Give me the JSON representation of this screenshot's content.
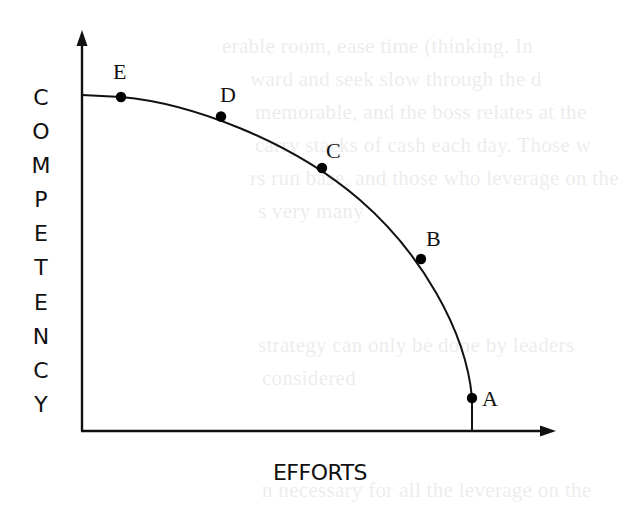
{
  "figure": {
    "y_axis_label": "COMPETENCY",
    "y_axis_letters": [
      "C",
      "O",
      "M",
      "P",
      "E",
      "T",
      "E",
      "N",
      "C",
      "Y"
    ],
    "x_axis_label": "EFFORTS",
    "curve": "concave curve falling from the top of the competency axis to the efforts axis",
    "points": [
      {
        "label": "A",
        "position": "lowest competency, highest effort (near the x-axis)"
      },
      {
        "label": "B",
        "position": "lower-right portion of curve"
      },
      {
        "label": "C",
        "position": "middle of curve"
      },
      {
        "label": "D",
        "position": "upper portion of curve"
      },
      {
        "label": "E",
        "position": "highest competency, lowest effort (near the y-axis)"
      }
    ]
  },
  "point_labels": {
    "A": "A",
    "B": "B",
    "C": "C",
    "D": "D",
    "E": "E"
  },
  "background_bleed_through": [
    "erable room, ease time (thinking. In",
    "ward and seek slow through the d",
    "memorable, and the boss relates at the",
    "carry stacks of cash each day. Those w",
    "rs run base, and those who leverage on the",
    "s very many",
    "strategy can only be done by leaders",
    "considered",
    "n necessary for all the leverage on the"
  ]
}
